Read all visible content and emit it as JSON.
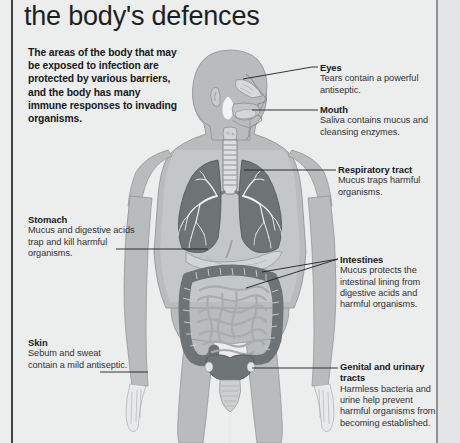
{
  "page": {
    "title": "the body's defences",
    "intro": "The areas of the body that may be exposed to infection are protected by various barriers, and the body has many immune responses to invading organisms."
  },
  "colors": {
    "background": "#eceded",
    "rule_left": "#3e4247",
    "rule_right": "#8e9295",
    "body_fill": "#b9bcbd",
    "body_inner": "#c9cccd",
    "organ_dark": "#6e7376",
    "organ_mid": "#9a9ea1",
    "organ_light": "#cfd2d3",
    "text_heading": "#17191b",
    "text_body": "#303336",
    "leader_line": "#1d1f21"
  },
  "callouts": [
    {
      "id": "eyes",
      "title": "Eyes",
      "description": "Tears contain a powerful antiseptic.",
      "side": "right"
    },
    {
      "id": "mouth",
      "title": "Mouth",
      "description": "Saliva contains mucus and cleansing enzymes.",
      "side": "right"
    },
    {
      "id": "respiratory-tract",
      "title": "Respiratory tract",
      "description": "Mucus traps harmful organisms.",
      "side": "right"
    },
    {
      "id": "intestines",
      "title": "Intestines",
      "description": "Mucus protects the intestinal lining from digestive acids and harmful organisms.",
      "side": "right"
    },
    {
      "id": "genital-urinary-tracts",
      "title": "Genital and urinary tracts",
      "description": "Harmless bacteria and urine help prevent harmful organisms from becoming established.",
      "side": "right"
    },
    {
      "id": "stomach",
      "title": "Stomach",
      "description": "Mucus and digestive acids trap and kill harmful organisms.",
      "side": "left"
    },
    {
      "id": "skin",
      "title": "Skin",
      "description": "Sebum and sweat contain a mild antiseptic.",
      "side": "left"
    }
  ],
  "anatomy": {
    "parts": [
      "head-profile",
      "nasal-cavity",
      "oral-cavity",
      "tongue",
      "trachea",
      "left-lung",
      "right-lung",
      "bronchial-tree",
      "stomach",
      "large-intestine",
      "small-intestine",
      "bladder",
      "torso-silhouette",
      "arms",
      "legs"
    ]
  }
}
